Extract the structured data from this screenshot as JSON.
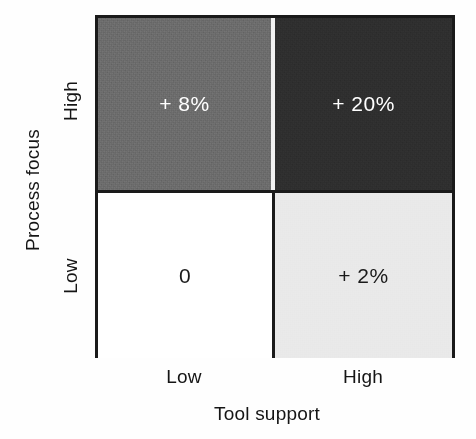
{
  "chart_data": {
    "type": "heatmap",
    "title": "",
    "xlabel": "Tool support",
    "ylabel": "Process focus",
    "x_categories": [
      "Low",
      "High"
    ],
    "y_categories": [
      "High",
      "Low"
    ],
    "grid": false,
    "legend": "none",
    "cells": [
      {
        "id": "high-low",
        "x": "Low",
        "y": "High",
        "value": 8,
        "label": "+ 8%",
        "fill": "#6b6b6b",
        "text_color": "#ffffff"
      },
      {
        "id": "high-high",
        "x": "High",
        "y": "High",
        "value": 20,
        "label": "+ 20%",
        "fill": "#2e2e2e",
        "text_color": "#ffffff"
      },
      {
        "id": "low-low",
        "x": "Low",
        "y": "Low",
        "value": 0,
        "label": "0",
        "fill": "#ffffff",
        "text_color": "#1a1a1a"
      },
      {
        "id": "low-high",
        "x": "High",
        "y": "Low",
        "value": 2,
        "label": "+ 2%",
        "fill": "#e9e9e9",
        "text_color": "#1a1a1a"
      }
    ],
    "values": [
      [
        8,
        20
      ],
      [
        0,
        2
      ]
    ],
    "axis_color": "#1a1a1a"
  },
  "axes": {
    "y": {
      "title": "Process focus",
      "ticks": {
        "high": "High",
        "low": "Low"
      }
    },
    "x": {
      "title": "Tool support",
      "ticks": {
        "low": "Low",
        "high": "High"
      }
    }
  }
}
